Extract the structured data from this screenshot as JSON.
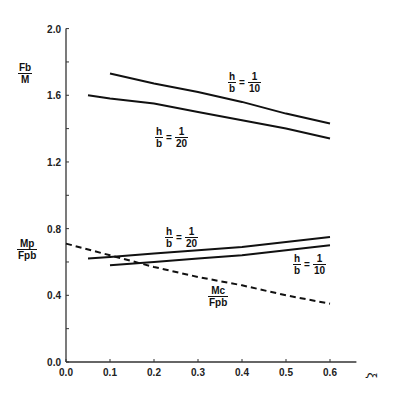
{
  "chart_data": {
    "type": "line",
    "title": "",
    "xlabel": "ξ",
    "ylabel_upper": "Fb/M",
    "ylabel_lower": "Mp/Fpb",
    "xlim": [
      0.0,
      0.65
    ],
    "ylim": [
      0.0,
      2.0
    ],
    "x_ticks": [
      "0.0",
      "0.1",
      "0.2",
      "0.3",
      "0.4",
      "0.5",
      "0.6"
    ],
    "y_ticks": [
      "0.0",
      "0.4",
      "0.8",
      "1.2",
      "1.6",
      "2.0"
    ],
    "grid": false,
    "series": [
      {
        "name": "Fb/M, h/b = 1/10",
        "style": "solid",
        "x": [
          0.1,
          0.2,
          0.3,
          0.4,
          0.5,
          0.6
        ],
        "y": [
          1.73,
          1.67,
          1.62,
          1.56,
          1.49,
          1.43
        ]
      },
      {
        "name": "Fb/M, h/b = 1/20",
        "style": "solid",
        "x": [
          0.05,
          0.1,
          0.2,
          0.3,
          0.4,
          0.5,
          0.6
        ],
        "y": [
          1.6,
          1.58,
          1.55,
          1.5,
          1.45,
          1.4,
          1.34
        ]
      },
      {
        "name": "Mp/Fpb, h/b = 1/20",
        "style": "solid",
        "x": [
          0.05,
          0.1,
          0.2,
          0.3,
          0.4,
          0.5,
          0.6
        ],
        "y": [
          0.62,
          0.63,
          0.65,
          0.67,
          0.69,
          0.72,
          0.75
        ]
      },
      {
        "name": "Mp/Fpb, h/b = 1/10",
        "style": "solid",
        "x": [
          0.1,
          0.2,
          0.3,
          0.4,
          0.5,
          0.6
        ],
        "y": [
          0.58,
          0.6,
          0.62,
          0.64,
          0.67,
          0.7
        ]
      },
      {
        "name": "Mc/Fpb",
        "style": "dashed",
        "x": [
          0.0,
          0.1,
          0.2,
          0.3,
          0.4,
          0.5,
          0.6
        ],
        "y": [
          0.71,
          0.64,
          0.57,
          0.51,
          0.46,
          0.4,
          0.35
        ]
      }
    ],
    "annotations": [
      {
        "num": "h",
        "den": "b",
        "value_num": "1",
        "value_den": "10",
        "near": "upper h/b=1/10 curve"
      },
      {
        "num": "h",
        "den": "b",
        "value_num": "1",
        "value_den": "20",
        "near": "upper h/b=1/20 curve"
      },
      {
        "num": "h",
        "den": "b",
        "value_num": "1",
        "value_den": "20",
        "near": "lower h/b=1/20 curve"
      },
      {
        "num": "h",
        "den": "b",
        "value_num": "1",
        "value_den": "10",
        "near": "lower h/b=1/10 curve"
      },
      {
        "num": "Mc",
        "den": "Fpb",
        "near": "dashed curve"
      }
    ]
  },
  "labels": {
    "upper_y": {
      "num": "Fb",
      "den": "M"
    },
    "lower_y": {
      "num": "Mp",
      "den": "Fpb"
    },
    "x_axis": "ξ",
    "eq_sign": "=",
    "ann_upper_10": {
      "num": "h",
      "den": "b",
      "vnum": "1",
      "vden": "10"
    },
    "ann_upper_20": {
      "num": "h",
      "den": "b",
      "vnum": "1",
      "vden": "20"
    },
    "ann_lower_20": {
      "num": "h",
      "den": "b",
      "vnum": "1",
      "vden": "20"
    },
    "ann_lower_10": {
      "num": "h",
      "den": "b",
      "vnum": "1",
      "vden": "10"
    },
    "ann_mc": {
      "num": "Mc",
      "den": "Fpb"
    }
  }
}
